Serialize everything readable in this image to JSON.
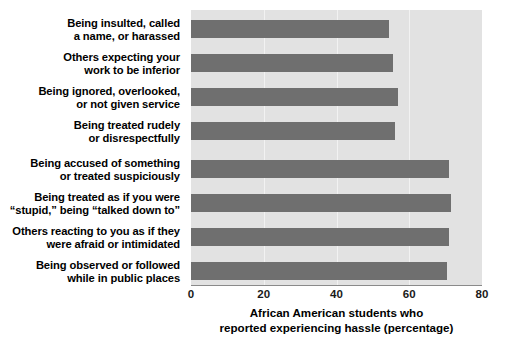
{
  "chart_data": {
    "type": "bar",
    "orientation": "horizontal",
    "title": "",
    "subtitle": "",
    "xlabel": "African American students who\nreported experiencing hassle (percentage)",
    "ylabel": "",
    "xlim": [
      0,
      80
    ],
    "xticks": [
      0,
      20,
      40,
      60,
      80
    ],
    "xtick_labels": [
      "0",
      "20",
      "40",
      "60",
      "80"
    ],
    "grid": true,
    "grid_axis": "x",
    "legend": false,
    "legend_position": "none",
    "categories": [
      "Being insulted, called\na name, or harassed",
      "Others expecting your\nwork to be inferior",
      "Being ignored, overlooked,\nor not given service",
      "Being treated rudely\nor disrespectfully",
      "Being accused of something\nor treated suspiciously",
      "Being treated as if you were\n“stupid,” being “talked down to”",
      "Others reacting to you as if they\nwere afraid or intimidated",
      "Being observed or followed\nwhile in public places"
    ],
    "values": [
      54.5,
      55.5,
      57,
      56,
      71,
      71.5,
      71,
      70.5
    ],
    "bar_color": "#6f6f6f",
    "plot_background": "#e2e2e2",
    "gridline_color": "#f2f2f2",
    "figure_background": "#ffffff"
  },
  "axis": {
    "tick_0": "0",
    "tick_1": "20",
    "tick_2": "40",
    "tick_3": "60",
    "tick_4": "80",
    "x_title": "African American students who\nreported experiencing hassle (percentage)"
  }
}
